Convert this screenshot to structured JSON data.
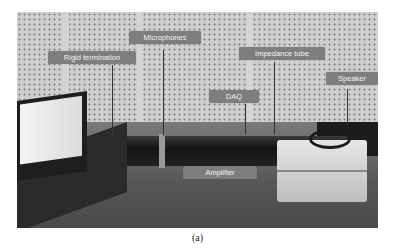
{
  "figure": {
    "labels": {
      "rigid_termination": "Rigid termination",
      "microphones": "Microphones",
      "impedance_tube": "Impedance tube",
      "speaker": "Speaker",
      "daq": "DAQ",
      "amplifier": "Amplifier"
    },
    "caption": "(a)"
  }
}
